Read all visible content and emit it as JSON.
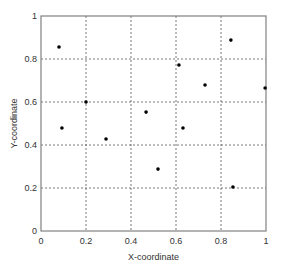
{
  "chart_data": {
    "type": "scatter",
    "title": "",
    "xlabel": "X-coordinate",
    "ylabel": "Y-coordinate",
    "xlim": [
      0,
      1
    ],
    "ylim": [
      0,
      1
    ],
    "xticks": [
      "0",
      "0.2",
      "0.4",
      "0.6",
      "0.8",
      "1"
    ],
    "yticks": [
      "0",
      "0.2",
      "0.4",
      "0.6",
      "0.8",
      "1"
    ],
    "grid": true,
    "legend": null,
    "marker_color": "#000000",
    "series": [
      {
        "name": "points",
        "points": [
          {
            "x": 0.08,
            "y": 0.856
          },
          {
            "x": 0.093,
            "y": 0.479
          },
          {
            "x": 0.2,
            "y": 0.6
          },
          {
            "x": 0.289,
            "y": 0.428
          },
          {
            "x": 0.467,
            "y": 0.553
          },
          {
            "x": 0.52,
            "y": 0.288
          },
          {
            "x": 0.613,
            "y": 0.772
          },
          {
            "x": 0.631,
            "y": 0.479
          },
          {
            "x": 0.729,
            "y": 0.679
          },
          {
            "x": 0.844,
            "y": 0.888
          },
          {
            "x": 0.853,
            "y": 0.205
          },
          {
            "x": 0.996,
            "y": 0.665
          }
        ]
      }
    ]
  },
  "layout": {
    "plot_left": 41,
    "plot_top": 16,
    "plot_right": 266,
    "plot_bottom": 231
  }
}
